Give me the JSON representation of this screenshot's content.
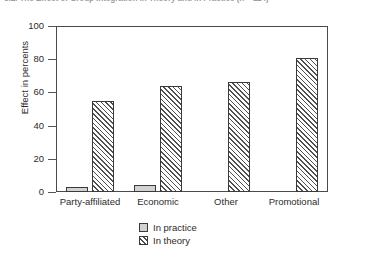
{
  "caption": "5.2. The Effect of Group Integration in Theory and in Practice (n = 114)",
  "chart_data": {
    "type": "bar",
    "title": "",
    "xlabel": "",
    "ylabel": "Effect in percents",
    "categories": [
      "Party-affiliated",
      "Economic",
      "Other",
      "Promotional"
    ],
    "series": [
      {
        "name": "In practice",
        "values": [
          3,
          4,
          0,
          0
        ]
      },
      {
        "name": "In theory",
        "values": [
          55,
          64,
          66,
          81
        ]
      }
    ],
    "ylim": [
      0,
      100
    ],
    "yticks": [
      0,
      20,
      40,
      60,
      80,
      100
    ],
    "ytick_labels": [
      "0",
      "20",
      "40",
      "60",
      "80",
      "100"
    ],
    "grid": false,
    "legend_position": "bottom",
    "colors": {
      "practice": "#d2d2d2",
      "theory": "#4f4f4f",
      "axis": "#4a4a4a",
      "text": "#2b2b2b"
    }
  }
}
